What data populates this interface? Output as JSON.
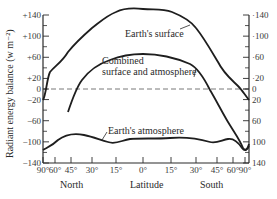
{
  "chart_data": {
    "type": "line",
    "title": "",
    "xlabel": "Latitude",
    "xlabel_north": "North",
    "xlabel_south": "South",
    "ylabel": "Radiant energy balance (w m⁻²)",
    "ylim": [
      -140,
      140
    ],
    "grid": false,
    "legend": "inline labels",
    "x_ticks": [
      "90°",
      "60°",
      "45°",
      "30°",
      "15°",
      "0°",
      "15°",
      "30°",
      "45°",
      "60°",
      "90°"
    ],
    "x_tick_pos": [
      43,
      55,
      71,
      92,
      116,
      143,
      171,
      196,
      217,
      233,
      245
    ],
    "y_ticks_left": [
      "+140",
      "+100",
      "+60",
      "+20",
      "0",
      "−20",
      "−60",
      "−100",
      "−140"
    ],
    "y_ticks_right": [
      "140",
      "100",
      "60",
      "20",
      "0",
      "20",
      "60",
      "100",
      "140"
    ],
    "y_tick_values": [
      140,
      100,
      60,
      20,
      0,
      -20,
      -60,
      -100,
      -140
    ],
    "zero_line": "dashed",
    "x": [
      "90N",
      "70N",
      "60N",
      "45N",
      "30N",
      "15N",
      "0",
      "15S",
      "30S",
      "45S",
      "60S",
      "70S",
      "90S"
    ],
    "series": [
      {
        "name": "Earth's surface",
        "values": [
          -30,
          -10,
          25,
          45,
          90,
          135,
          138,
          135,
          105,
          60,
          20,
          -5,
          -20
        ]
      },
      {
        "name": "Combined surface and atmosphere",
        "values": [
          -110,
          -95,
          -55,
          -25,
          10,
          35,
          45,
          45,
          35,
          -5,
          -50,
          -80,
          -105
        ]
      },
      {
        "name": "Earth's atmosphere",
        "values": [
          -110,
          -105,
          -95,
          -85,
          -85,
          -100,
          -95,
          -95,
          -95,
          -100,
          -95,
          -100,
          -115
        ]
      }
    ]
  },
  "labels": {
    "surface": "Earth's surface",
    "combined_line1": "Combined",
    "combined_line2": "surface and atmosphere",
    "atmosphere": "Earth's atmosphere"
  }
}
